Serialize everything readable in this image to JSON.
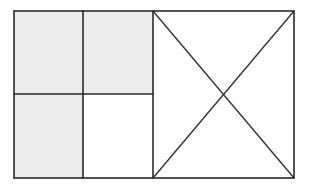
{
  "diagram": {
    "grid": {
      "rows": 2,
      "cols": 2,
      "cells": [
        {
          "row": 0,
          "col": 0,
          "shaded": true
        },
        {
          "row": 0,
          "col": 1,
          "shaded": true
        },
        {
          "row": 1,
          "col": 0,
          "shaded": true
        },
        {
          "row": 1,
          "col": 1,
          "shaded": false
        }
      ],
      "shaded_count": 3,
      "total_count": 4
    },
    "right_square": {
      "diagonals": 2
    },
    "colors": {
      "shade": "#ececec",
      "line": "#2a2a2a",
      "background": "#ffffff"
    }
  }
}
